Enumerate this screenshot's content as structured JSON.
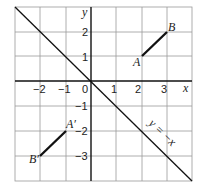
{
  "diagram": {
    "axes": {
      "x_label": "x",
      "y_label": "y",
      "origin_label": "0",
      "x_ticks": [
        {
          "value": -2,
          "label": "−2"
        },
        {
          "value": -1,
          "label": "−1"
        },
        {
          "value": 1,
          "label": "1"
        },
        {
          "value": 2,
          "label": "2"
        },
        {
          "value": 3,
          "label": "3"
        }
      ],
      "y_ticks": [
        {
          "value": 2,
          "label": "2"
        },
        {
          "value": 1,
          "label": "1"
        },
        {
          "value": -1,
          "label": "−1"
        },
        {
          "value": -2,
          "label": "−2"
        },
        {
          "value": -3,
          "label": "−3"
        }
      ],
      "x_range": [
        -3,
        4
      ],
      "y_range": [
        -4,
        3
      ]
    },
    "mirror_line": {
      "label": "y = −x",
      "equation": "y = -x"
    },
    "segments": [
      {
        "name": "AB",
        "start": {
          "label": "A",
          "x": 2,
          "y": 1
        },
        "end": {
          "label": "B",
          "x": 3,
          "y": 2
        }
      },
      {
        "name": "A'B'",
        "start": {
          "label": "A′",
          "x": -1,
          "y": -2
        },
        "end": {
          "label": "B′",
          "x": -2,
          "y": -3
        }
      }
    ],
    "colors": {
      "grid": "#9a9a9a",
      "axis": "#111111",
      "segment": "#111111"
    }
  }
}
